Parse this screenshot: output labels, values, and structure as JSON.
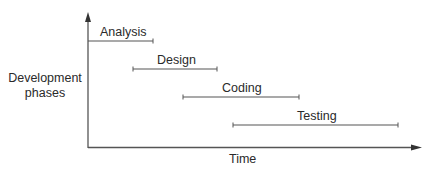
{
  "diagram": {
    "type": "waterfall-phase-timeline",
    "y_axis_label_line1": "Development",
    "y_axis_label_line2": "phases",
    "x_axis_label": "Time",
    "colors": {
      "line": "#555555",
      "text": "#2a2a2a",
      "background": "#ffffff"
    },
    "phases": [
      {
        "label": "Analysis",
        "start": 0,
        "end": 65
      },
      {
        "label": "Design",
        "start": 45,
        "end": 129
      },
      {
        "label": "Coding",
        "start": 95,
        "end": 211
      },
      {
        "label": "Testing",
        "start": 145,
        "end": 310
      }
    ]
  }
}
